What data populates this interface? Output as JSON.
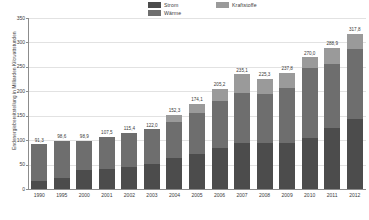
{
  "chart_data": {
    "type": "bar",
    "subtype": "stacked-bar",
    "title": "",
    "xlabel": "",
    "ylabel": "Endenergiebereitstellung in Milliarden Kilowattstunden",
    "ylim": [
      0,
      350
    ],
    "yticks": [
      0,
      50,
      100,
      150,
      200,
      250,
      300,
      350
    ],
    "grid": true,
    "legend_position": "top-center",
    "categories": [
      "1990",
      "1995",
      "2000",
      "2001",
      "2002",
      "2003",
      "2004",
      "2005",
      "2006",
      "2007",
      "2008",
      "2009",
      "2010",
      "2011",
      "2012"
    ],
    "series": [
      {
        "name": "Strom",
        "color": "#4c4c4c",
        "values": [
          17.4,
          22.3,
          37.9,
          40.1,
          45.0,
          50.8,
          62.5,
          72.0,
          83.5,
          94.2,
          93.3,
          95.0,
          105.2,
          124.1,
          142.4
        ]
      },
      {
        "name": "Wärme",
        "color": "#6e6e6e",
        "values": [
          73.9,
          76.3,
          61.0,
          67.4,
          70.4,
          71.2,
          75.4,
          84.4,
          97.3,
          103.0,
          101.0,
          111.5,
          142.8,
          132.8,
          143.5
        ]
      },
      {
        "name": "Kraftstoffe",
        "color": "#9a9a9a",
        "values": [
          0.0,
          0.0,
          0.0,
          0.0,
          0.0,
          0.0,
          14.4,
          17.7,
          24.4,
          37.9,
          31.0,
          31.3,
          22.0,
          32.0,
          31.9
        ]
      }
    ],
    "totals": [
      91.3,
      98.6,
      98.9,
      107.5,
      115.4,
      122.0,
      152.3,
      174.1,
      205.2,
      235.1,
      225.3,
      237.8,
      270.0,
      288.9,
      317.8
    ],
    "total_labels": [
      "91,3",
      "98,6",
      "98,9",
      "107,5",
      "115,4",
      "122,0",
      "152,3",
      "174,1",
      "205,2",
      "235,1",
      "225,3",
      "237,8",
      "270,0",
      "288,9",
      "317,8"
    ],
    "ytick_labels": [
      "0",
      "50",
      "100",
      "150",
      "200",
      "250",
      "300",
      "350"
    ]
  },
  "legend": {
    "items": [
      {
        "label": "Strom",
        "color": "#4c4c4c"
      },
      {
        "label": "Wärme",
        "color": "#6e6e6e"
      },
      {
        "label": "Kraftstoffe",
        "color": "#9a9a9a"
      }
    ]
  },
  "colors": {
    "strom": "#4c4c4c",
    "waerme": "#6e6e6e",
    "kraftstoffe": "#9a9a9a",
    "grid": "#e2e2e2",
    "axis": "#8c8c8c",
    "text": "#3a3a3a",
    "background": "#ffffff"
  }
}
